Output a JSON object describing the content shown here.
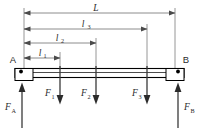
{
  "figure": {
    "type": "free-body-diagram"
  },
  "nodes": {
    "left_support_label": "A",
    "right_support_label": "B"
  },
  "dimensions": [
    {
      "id": "L",
      "symbol": "L",
      "subscript": "",
      "start_x": 24,
      "end_x": 175,
      "y": 13
    },
    {
      "id": "l3",
      "symbol": "l",
      "subscript": "3",
      "start_x": 24,
      "end_x": 147,
      "y": 29
    },
    {
      "id": "l2",
      "symbol": "l",
      "subscript": "2",
      "start_x": 24,
      "end_x": 96,
      "y": 43
    },
    {
      "id": "l1",
      "symbol": "l",
      "subscript": "1",
      "start_x": 24,
      "end_x": 60,
      "y": 58
    }
  ],
  "loads": [
    {
      "id": "F1",
      "symbol": "F",
      "subscript": "1",
      "x": 60,
      "direction": "down"
    },
    {
      "id": "F2",
      "symbol": "F",
      "subscript": "2",
      "x": 96,
      "direction": "down"
    },
    {
      "id": "F3",
      "symbol": "F",
      "subscript": "3",
      "x": 147,
      "direction": "down"
    }
  ],
  "reactions": [
    {
      "id": "FA",
      "symbol": "F",
      "subscript": "A",
      "x": 24,
      "direction": "up"
    },
    {
      "id": "FB",
      "symbol": "F",
      "subscript": "B",
      "x": 175,
      "direction": "up"
    }
  ],
  "colors": {
    "beam_outline": "#000000",
    "dimension_line": "#6e6e6e",
    "arrow": "#2b2b2b",
    "background": "#ffffff"
  }
}
